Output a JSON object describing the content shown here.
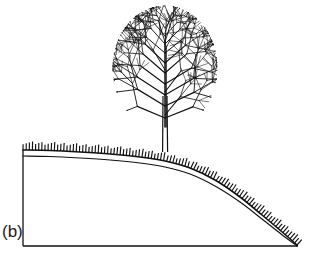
{
  "figure": {
    "panel_label": "(b)",
    "caption_text": "",
    "background_color": "#ffffff",
    "ink_color": "#000000",
    "width": 313,
    "height": 259
  },
  "scene": {
    "tree": {
      "name": "tree",
      "trunk": {
        "x_left": 163.0,
        "x_right": 167.0,
        "y_top": 96.0,
        "y_base": 152.0,
        "stroke_width": 1.2
      },
      "crown": {
        "shape": "oval",
        "center_x": 165,
        "center_y": 68,
        "radius_x": 52,
        "radius_y": 62,
        "top_y": 8,
        "bottom_y": 125,
        "left_x": 113,
        "right_x": 217,
        "branch_levels": 4,
        "branch_style": "fractal-dichotomous",
        "stroke_width": 0.9
      }
    },
    "ground": {
      "name": "hillslope",
      "surface_line": {
        "label": "grass-surface",
        "points": [
          [
            23,
            150
          ],
          [
            50,
            150.5
          ],
          [
            80,
            152
          ],
          [
            110,
            154
          ],
          [
            140,
            157
          ],
          [
            165,
            161
          ],
          [
            190,
            168
          ],
          [
            215,
            180
          ],
          [
            240,
            197
          ],
          [
            262,
            215
          ],
          [
            281,
            231
          ],
          [
            297,
            245
          ]
        ]
      },
      "soil_line": {
        "label": "soil-horizon",
        "points": [
          [
            23,
            156
          ],
          [
            50,
            156.5
          ],
          [
            80,
            158
          ],
          [
            110,
            160
          ],
          [
            140,
            163
          ],
          [
            165,
            167
          ],
          [
            190,
            174
          ],
          [
            215,
            186
          ],
          [
            240,
            202
          ],
          [
            262,
            219
          ],
          [
            281,
            234
          ],
          [
            297,
            246
          ]
        ]
      },
      "grass_ticks": {
        "label": "grass-tufts",
        "count": 96,
        "length": 8,
        "spacing": 2.9
      },
      "left_edge": {
        "x": 23,
        "y_top": 150,
        "y_bottom": 246
      },
      "bottom_edge": {
        "x_left": 23,
        "x_right": 298,
        "y": 246
      }
    }
  },
  "colors": {
    "ink": "#111111",
    "paper": "#ffffff"
  }
}
